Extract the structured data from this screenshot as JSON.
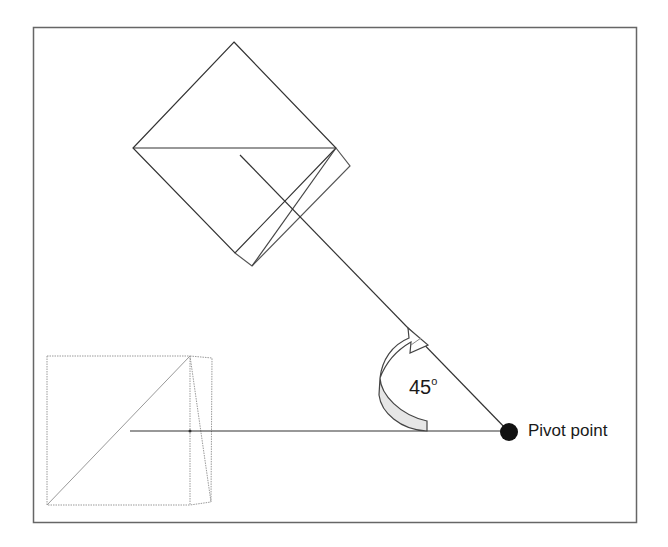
{
  "diagram": {
    "type": "rotation-illustration",
    "angle": {
      "value": "45",
      "unit_superscript": "o"
    },
    "pivot_label": "Pivot point",
    "colors": {
      "frame": "#555555",
      "line": "#333333",
      "ghost": "#9a9a9a",
      "arrow_fill": "#e6e6e6",
      "pivot": "#111111"
    }
  }
}
